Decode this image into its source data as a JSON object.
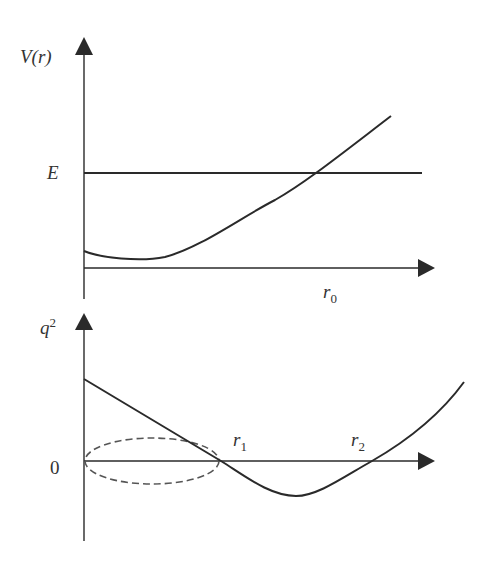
{
  "colors": {
    "line": "#2a2a2a",
    "dashed": "#555555",
    "text": "#333333",
    "background": "#ffffff"
  },
  "upper_panel": {
    "y_label": "V(r)",
    "energy_label": "E",
    "x_marker_label": {
      "base": "r",
      "sub": "0"
    },
    "curves": [
      "potential V(r)",
      "energy level E"
    ]
  },
  "lower_panel": {
    "y_label": {
      "base": "q",
      "sup": "2"
    },
    "zero_label": "0",
    "x_marker_labels": [
      {
        "base": "r",
        "sub": "1"
      },
      {
        "base": "r",
        "sub": "2"
      }
    ],
    "curves": [
      "q^2(r)",
      "dashed ellipse region r < r1"
    ]
  }
}
